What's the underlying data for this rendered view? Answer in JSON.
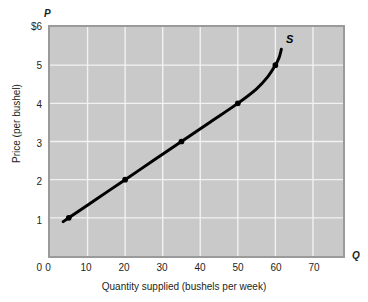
{
  "chart_data": {
    "type": "line",
    "title": "",
    "subtitle": "",
    "xlabel": "Quantity supplied (bushels per week)",
    "ylabel": "Price (per bushel)",
    "x_axis_symbol": "Q",
    "y_axis_symbol": "P",
    "curve_label": "S",
    "xlim": [
      0,
      78
    ],
    "ylim": [
      0,
      6
    ],
    "grid": true,
    "legend_position": "none",
    "x_ticks": [
      {
        "value": 0,
        "label": "0"
      },
      {
        "value": 10,
        "label": "10"
      },
      {
        "value": 20,
        "label": "20"
      },
      {
        "value": 30,
        "label": "30"
      },
      {
        "value": 40,
        "label": "40"
      },
      {
        "value": 50,
        "label": "50"
      },
      {
        "value": 60,
        "label": "60"
      },
      {
        "value": 70,
        "label": "70"
      }
    ],
    "y_ticks": [
      {
        "value": 0,
        "label": "0"
      },
      {
        "value": 1,
        "label": "1"
      },
      {
        "value": 2,
        "label": "2"
      },
      {
        "value": 3,
        "label": "3"
      },
      {
        "value": 4,
        "label": "4"
      },
      {
        "value": 5,
        "label": "5"
      },
      {
        "value": 6,
        "label": "$6"
      }
    ],
    "series": [
      {
        "name": "S",
        "marked_points": [
          {
            "x": 5,
            "y": 1
          },
          {
            "x": 20,
            "y": 2
          },
          {
            "x": 35,
            "y": 3
          },
          {
            "x": 50,
            "y": 4
          },
          {
            "x": 60,
            "y": 5
          }
        ],
        "curve_points": [
          {
            "x": 3.5,
            "y": 0.9
          },
          {
            "x": 5,
            "y": 1
          },
          {
            "x": 12.5,
            "y": 1.5
          },
          {
            "x": 20,
            "y": 2
          },
          {
            "x": 27.5,
            "y": 2.5
          },
          {
            "x": 35,
            "y": 3
          },
          {
            "x": 42.5,
            "y": 3.5
          },
          {
            "x": 50,
            "y": 4
          },
          {
            "x": 55,
            "y": 4.38
          },
          {
            "x": 58,
            "y": 4.7
          },
          {
            "x": 60,
            "y": 5
          },
          {
            "x": 61,
            "y": 5.2
          },
          {
            "x": 61.6,
            "y": 5.42
          }
        ]
      }
    ]
  }
}
